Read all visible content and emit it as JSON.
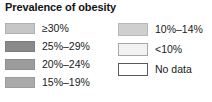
{
  "legend": {
    "title": "Prevalence of obesity",
    "columns": [
      {
        "name": "left",
        "entries": [
          {
            "label": "≥30%",
            "color": "#c6c6c6",
            "border": "#b0b0b0"
          },
          {
            "label": "25%–29%",
            "color": "#8a8a8a",
            "border": "#7c7c7c"
          },
          {
            "label": "20%–24%",
            "color": "#9c9c9c",
            "border": "#8e8e8e"
          },
          {
            "label": "15%–19%",
            "color": "#aaaaaa",
            "border": "#9c9c9c"
          }
        ]
      },
      {
        "name": "right",
        "entries": [
          {
            "label": "10%–14%",
            "color": "#cfcfcf",
            "border": "#b8b8b8"
          },
          {
            "label": "<10%",
            "color": "#f2f2f2",
            "border": "#a8a8a8"
          },
          {
            "label": "No data",
            "color": "#ffffff",
            "border": "#5a5a5a"
          }
        ]
      }
    ]
  }
}
